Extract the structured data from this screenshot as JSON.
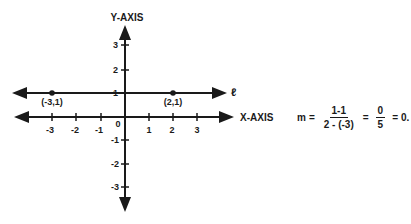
{
  "diagram": {
    "y_axis_label": "Y-AXIS",
    "x_axis_label": "X-AXIS",
    "line_label": "ℓ",
    "origin_label": "0",
    "x_ticks": [
      "-3",
      "-2",
      "-1",
      "1",
      "2",
      "3"
    ],
    "y_ticks": [
      "3",
      "2",
      "1",
      "-1",
      "-2",
      "-3"
    ],
    "points": [
      {
        "label": "(-3,1)",
        "x": -3,
        "y": 1
      },
      {
        "label": "(2,1)",
        "x": 2,
        "y": 1
      }
    ],
    "line_color": "#1a1a1a"
  },
  "equation": {
    "lhs": "m",
    "eq1": "=",
    "frac1_num": "1-1",
    "frac1_den": "2 - (-3)",
    "eq2": "=",
    "frac2_num": "0",
    "frac2_den": "5",
    "eq3": "=",
    "result": "0."
  }
}
